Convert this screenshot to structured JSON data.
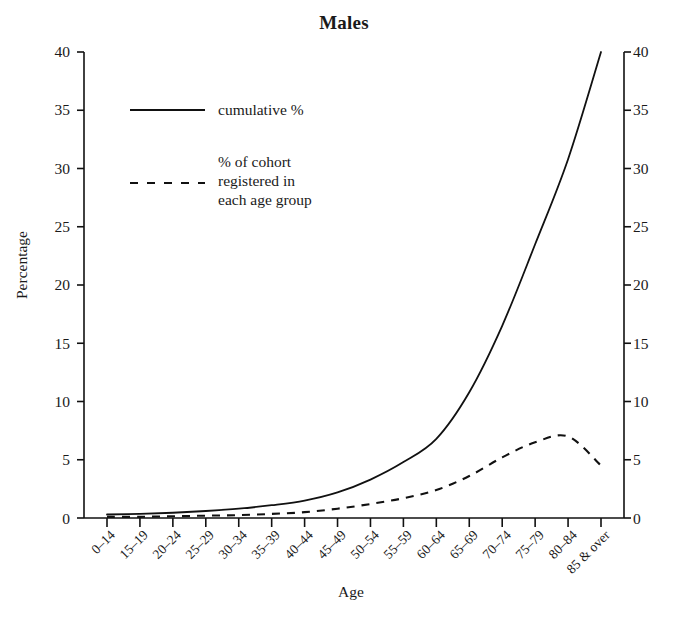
{
  "chart_data": {
    "type": "line",
    "title": "Males",
    "xlabel": "Age",
    "ylabel": "Percentage",
    "categories": [
      "0–14",
      "15–19",
      "20–24",
      "25–29",
      "30–34",
      "35–39",
      "40–44",
      "45–49",
      "50–54",
      "55–59",
      "60–64",
      "65–69",
      "70–74",
      "75–79",
      "80–84",
      "85 & over"
    ],
    "ylim": [
      0,
      40
    ],
    "yticks": [
      0,
      5,
      10,
      15,
      20,
      25,
      30,
      35,
      40
    ],
    "y2lim": [
      0,
      40
    ],
    "y2ticks": [
      0,
      5,
      10,
      15,
      20,
      25,
      30,
      35,
      40
    ],
    "grid": false,
    "legend_position": "upper left",
    "series": [
      {
        "name": "cumulative %",
        "style": "solid",
        "color": "#111111",
        "values": [
          0.3,
          0.35,
          0.45,
          0.6,
          0.8,
          1.1,
          1.5,
          2.2,
          3.3,
          4.8,
          6.8,
          10.8,
          16.5,
          23.5,
          30.8,
          40.0
        ]
      },
      {
        "name": "% of cohort registered in each age group",
        "style": "dashed",
        "color": "#111111",
        "values": [
          0.1,
          0.1,
          0.15,
          0.2,
          0.25,
          0.35,
          0.5,
          0.8,
          1.2,
          1.7,
          2.4,
          3.6,
          5.2,
          6.5,
          7.0,
          6.6
        ]
      }
    ]
  },
  "chart": {
    "title": "Males",
    "axis": {
      "y_label": "Percentage",
      "x_label": "Age",
      "y_ticks": [
        "0",
        "5",
        "10",
        "15",
        "20",
        "25",
        "30",
        "35",
        "40"
      ],
      "y2_ticks": [
        "0",
        "5",
        "10",
        "15",
        "20",
        "25",
        "30",
        "35",
        "40"
      ],
      "x_ticks": [
        "0–14",
        "15–19",
        "20–24",
        "25–29",
        "30–34",
        "35–39",
        "40–44",
        "45–49",
        "50–54",
        "55–59",
        "60–64",
        "65–69",
        "70–74",
        "75–79",
        "80–84",
        "85 & over"
      ]
    },
    "legend": {
      "entry_solid": "cumulative %",
      "entry_dashed": "% of cohort\nregistered in\neach age group"
    },
    "colors": {
      "ink": "#111111",
      "background": "#ffffff"
    }
  }
}
